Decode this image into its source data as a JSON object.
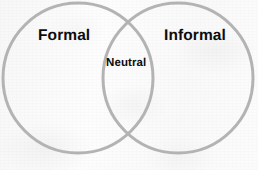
{
  "diagram": {
    "type": "venn-2-circle",
    "title": "",
    "background_color": "#fbfbfb",
    "circle_stroke_color": "#b3b3b3",
    "circle_fill": "none",
    "circle_stroke_width": 3,
    "label_color": "#0d0d0d",
    "sets": [
      {
        "id": "formal",
        "label": "Formal",
        "center_x": 78,
        "center_y": 78,
        "radius": 75
      },
      {
        "id": "informal",
        "label": "Informal",
        "center_x": 178,
        "center_y": 78,
        "radius": 75
      }
    ],
    "intersection": {
      "id": "neutral",
      "label": "Neutral"
    }
  }
}
